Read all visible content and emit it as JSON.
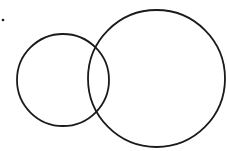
{
  "diagram": {
    "type": "overlapping-circles",
    "background": "#ffffff",
    "stroke_color": "#1a1a1a",
    "stroke_width": 1.8,
    "dot": {
      "cx": 3,
      "cy": 20,
      "r": 1.3
    },
    "circles": [
      {
        "name": "small-circle",
        "cx": 63,
        "cy": 80,
        "r": 46
      },
      {
        "name": "large-circle",
        "cx": 156.5,
        "cy": 78.5,
        "r": 68.5
      }
    ]
  }
}
